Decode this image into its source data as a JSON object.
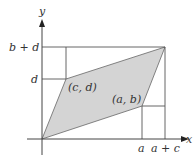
{
  "diagram": {
    "type": "parallelogram-area",
    "axes": {
      "x_label": "x",
      "y_label": "y"
    },
    "points": {
      "origin": {
        "label": "",
        "px": [
          42,
          139
        ]
      },
      "ab": {
        "label": "(a, b)",
        "px": [
          142,
          106
        ]
      },
      "cd": {
        "label": "(c, d)",
        "px": [
          66,
          79
        ]
      },
      "sum": {
        "label": "",
        "px": [
          165,
          47
        ]
      }
    },
    "tick_labels": {
      "x": [
        "a",
        "a + c"
      ],
      "y": [
        "d",
        "b + d"
      ]
    },
    "colors": {
      "fill": "#d4d4d4",
      "stroke": "#555555",
      "axis": "#444444",
      "text": "#333333"
    }
  }
}
